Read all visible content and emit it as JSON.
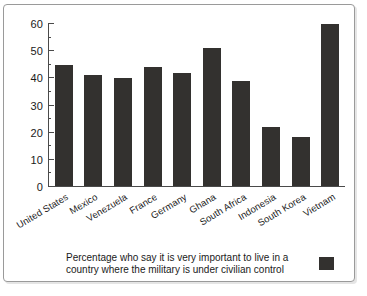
{
  "chart_data": {
    "type": "bar",
    "title": "",
    "subtitle": "",
    "xlabel": "",
    "ylabel": "",
    "ylim": [
      0,
      60
    ],
    "ytick_step": 10,
    "grid": false,
    "categories": [
      "United States",
      "Mexico",
      "Venezuela",
      "France",
      "Germany",
      "Ghana",
      "South Africa",
      "Indonesia",
      "South Korea",
      "Vietnam"
    ],
    "values": [
      45,
      41,
      40,
      44,
      42,
      51,
      39,
      22,
      18,
      60
    ],
    "ytick_labels": [
      "0",
      "10",
      "20",
      "30",
      "40",
      "50",
      "60"
    ],
    "bar_color": "#33312f",
    "legend": {
      "position": "bottom",
      "entries": [
        {
          "label_line1": "Percentage who say it is very important to live in a",
          "label_line2": "country where the military is under civilian control",
          "color": "#33312f"
        }
      ]
    }
  },
  "colors": {
    "bar": "#33312f",
    "axis": "#4a4a4a",
    "border": "#9a9a9a",
    "background": "#ffffff",
    "text": "#1a1a1a"
  }
}
